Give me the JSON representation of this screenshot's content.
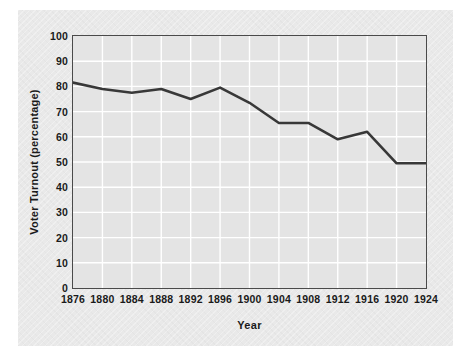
{
  "chart_data": {
    "type": "line",
    "title": "",
    "xlabel": "Year",
    "ylabel": "Voter Turnout (percentage)",
    "x": [
      1876,
      1880,
      1884,
      1888,
      1892,
      1896,
      1900,
      1904,
      1908,
      1912,
      1916,
      1920,
      1924
    ],
    "xticklabels": [
      "1876",
      "1880",
      "1884",
      "1888",
      "1892",
      "1896",
      "1900",
      "1904",
      "1908",
      "1912",
      "1916",
      "1920",
      "1924"
    ],
    "values": [
      81.5,
      79.0,
      77.5,
      79.0,
      75.0,
      79.5,
      73.5,
      65.5,
      65.5,
      59.0,
      62.0,
      49.5,
      49.5
    ],
    "series": [
      {
        "name": "Voter Turnout",
        "values": [
          81.5,
          79.0,
          77.5,
          79.0,
          75.0,
          79.5,
          73.5,
          65.5,
          65.5,
          59.0,
          62.0,
          49.5,
          49.5
        ]
      }
    ],
    "yticks": [
      0,
      10,
      20,
      30,
      40,
      50,
      60,
      70,
      80,
      90,
      100
    ],
    "yticklabels": [
      "0",
      "10",
      "20",
      "30",
      "40",
      "50",
      "60",
      "70",
      "80",
      "90",
      "100"
    ],
    "ylim": [
      0,
      100
    ],
    "xlim": [
      1876,
      1924
    ],
    "grid": true,
    "grid_color": "#ffffff",
    "legend": false,
    "line_color": "#383838",
    "plot_bgcolor": "#e4e4e4",
    "figure_bgcolor": "#e9e9e9",
    "axis_color": "#4a4a4a"
  }
}
